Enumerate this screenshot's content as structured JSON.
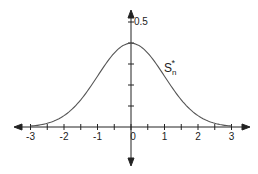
{
  "chart_data": {
    "type": "line",
    "title": "",
    "xlabel": "",
    "ylabel": "",
    "series": [
      {
        "name": "S_n^*",
        "description": "standard normal density curve",
        "mu": 0,
        "sigma": 1
      }
    ],
    "x_ticks": [
      "-3",
      "-2",
      "-1",
      "0",
      "1",
      "2",
      "3"
    ],
    "y_tick_label": "0.5",
    "y_ticks": [
      0.1,
      0.2,
      0.3,
      0.4,
      0.5
    ],
    "xlim": [
      -3.3,
      3.3
    ],
    "ylim": [
      0,
      0.55
    ],
    "peak": {
      "x": 0,
      "y": 0.4
    },
    "annotation": {
      "text": "S",
      "sub": "n",
      "sup": "*"
    },
    "grid": false,
    "legend": "none"
  }
}
